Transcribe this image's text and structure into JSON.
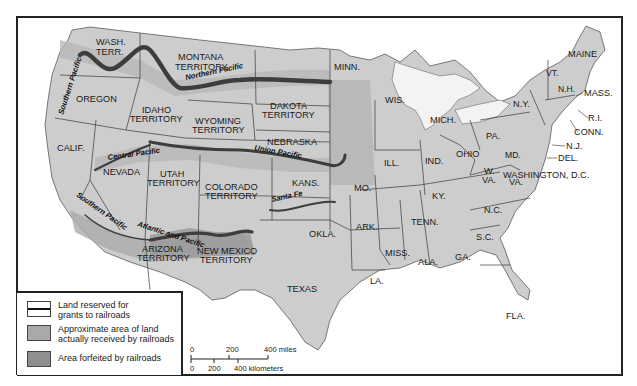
{
  "map": {
    "subject": "Railroad land grants in the United States",
    "colors": {
      "land": "#cfcfcf",
      "land_dark": "#bdbdbd",
      "water": "#ffffff",
      "border": "#3a3a3a",
      "reserved_line": "#4a4a4a",
      "received_area": "#a9a9a9",
      "forfeited_area": "#8f8f8f",
      "frame": "#222222"
    },
    "regions": {
      "wash": "WASH.",
      "wash2": "TERR.",
      "montana": "MONTANA",
      "montana2": "TERRITORY",
      "oregon": "OREGON",
      "idaho": "IDAHO",
      "idaho2": "TERRITORY",
      "wyoming": "WYOMING",
      "wyoming2": "TERRITORY",
      "dakota": "DAKOTA",
      "dakota2": "TERRITORY",
      "minn": "MINN.",
      "wis": "WIS.",
      "mich": "MICH.",
      "nebraska": "NEBRASKA",
      "calif": "CALIF.",
      "nevada": "NEVADA",
      "utah": "UTAH",
      "utah2": "TERRITORY",
      "colorado": "COLORADO",
      "colorado2": "TERRITORY",
      "kans": "KANS.",
      "ill": "ILL.",
      "ind": "IND.",
      "ohio": "OHIO",
      "mo": "MO.",
      "ky": "KY.",
      "wva": "W.",
      "wva2": "VA.",
      "va": "VA.",
      "pa": "PA.",
      "ny": "N.Y.",
      "vt": "VT.",
      "nh": "N.H.",
      "maine": "MAINE",
      "mass": "MASS.",
      "ri": "R.I.",
      "conn": "CONN.",
      "nj": "N.J.",
      "md": "MD.",
      "del": "DEL.",
      "dc": "WASHINGTON, D.C.",
      "arizona": "ARIZONA",
      "arizona2": "TERRITORY",
      "newmexico": "NEW MEXICO",
      "newmexico2": "TERRITORY",
      "okla": "OKLA.",
      "ark": "ARK.",
      "tenn": "TENN.",
      "nc": "N.C.",
      "sc": "S.C.",
      "miss": "MISS.",
      "ala": "ALA.",
      "ga": "GA.",
      "la": "LA.",
      "texas": "TEXAS",
      "fla": "FLA."
    },
    "railroads": {
      "northern_pacific": "Northern Pacific",
      "southern_pacific_north": "Southern Pacific",
      "central_pacific": "Central Pacific",
      "union_pacific": "Union Pacific",
      "santa_fe": "Santa Fe",
      "southern_pacific_south": "Southern Pacific",
      "atlantic_pacific": "Atlantic and Pacific"
    }
  },
  "legend": {
    "items": [
      {
        "swatch": "reserved",
        "label_line1": "Land reserved for",
        "label_line2": "grants to railroads"
      },
      {
        "swatch": "received",
        "label_line1": "Approximate area of land",
        "label_line2": "actually received by railroads"
      },
      {
        "swatch": "forfeited",
        "label_line1": "Area forfeited by railroads",
        "label_line2": ""
      }
    ]
  },
  "scale": {
    "miles_ticks": [
      "0",
      "200",
      "400 miles"
    ],
    "km_ticks": [
      "0",
      "200",
      "400 kilometers"
    ]
  }
}
